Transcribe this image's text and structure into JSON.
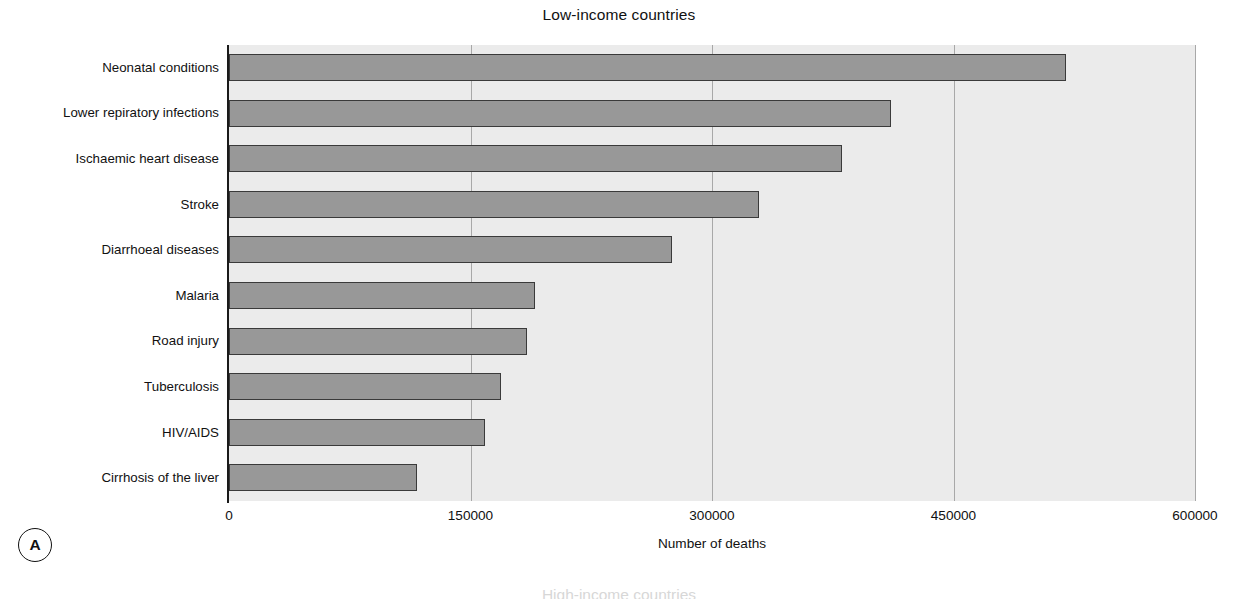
{
  "figure": {
    "panel_tag": "A",
    "next_panel_title_partial": "High-income countries"
  },
  "chart_data": {
    "type": "bar",
    "orientation": "horizontal",
    "title": "Low-income countries",
    "xlabel": "Number of deaths",
    "ylabel": "",
    "categories": [
      "Neonatal conditions",
      "Lower repiratory infections",
      "Ischaemic heart disease",
      "Stroke",
      "Diarrhoeal diseases",
      "Malaria",
      "Road injury",
      "Tuberculosis",
      "HIV/AIDS",
      "Cirrhosis of the liver"
    ],
    "values": [
      520000,
      411000,
      381000,
      329000,
      275000,
      190000,
      185000,
      169000,
      159000,
      117000
    ],
    "xlim": [
      0,
      600000
    ],
    "xticks": [
      0,
      150000,
      300000,
      450000,
      600000
    ],
    "xtick_labels": [
      "0",
      "150000",
      "300000",
      "450000",
      "600000"
    ],
    "grid": "vertical",
    "legend": "none",
    "bar_color": "#989898",
    "bar_edge_color": "#3a3a3a",
    "plot_background": "#ebebeb",
    "gridline_color": "#a8a8a8"
  }
}
